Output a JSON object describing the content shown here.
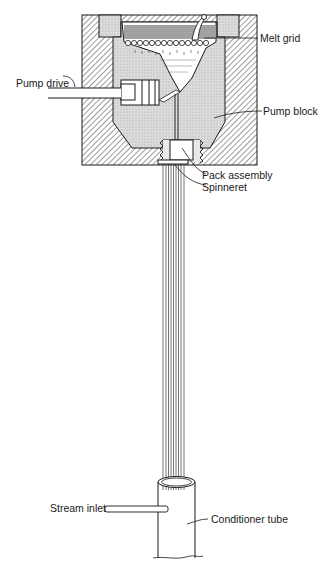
{
  "diagram": {
    "type": "cross-section schematic",
    "labels": {
      "melt_grid": "Melt grid",
      "pump_drive": "Pump drive",
      "pump_block": "Pump block",
      "pack_assembly": "Pack assembly",
      "spinneret": "Spinneret",
      "stream_inlet": "Stream inlet",
      "conditioner_tube": "Conditioner tube"
    },
    "colors": {
      "line": "#1a1a1a",
      "hatch": "#3a3a3a",
      "cavity_fill": "#d8d8d8",
      "melt_fill": "#bdbdbd",
      "background": "#ffffff"
    }
  }
}
